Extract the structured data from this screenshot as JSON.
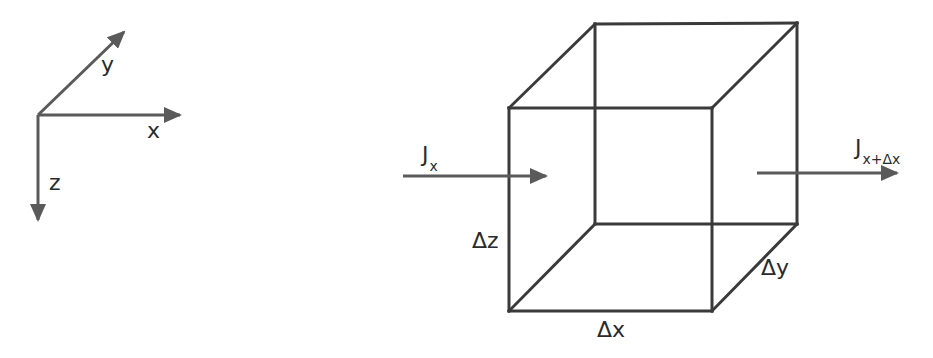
{
  "figure": {
    "axes": {
      "x_label": "x",
      "y_label": "y",
      "z_label": "z"
    },
    "cube": {
      "dx_label": "Δx",
      "dy_label": "Δy",
      "dz_label": "Δz"
    },
    "flux_in": {
      "symbol": "J",
      "subscript": "x"
    },
    "flux_out": {
      "symbol": "J",
      "subscript": "x+Δx"
    }
  },
  "colors": {
    "line": "#3a3a3a",
    "arrow": "#555555",
    "text": "#2b2b2b",
    "background": "#ffffff"
  }
}
